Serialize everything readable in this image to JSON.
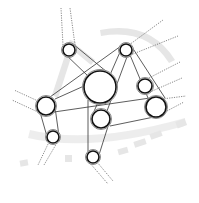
{
  "diagram": {
    "type": "belt-pulley-network",
    "width": 199,
    "height": 203,
    "colors": {
      "line": "#333333",
      "dashed": "#555555",
      "ring": "#111111",
      "watermark": "#e6e6e6"
    },
    "pulleys": [
      {
        "id": "A",
        "cx": 69,
        "cy": 50,
        "r": 6
      },
      {
        "id": "B",
        "cx": 100,
        "cy": 87,
        "r": 16
      },
      {
        "id": "C",
        "cx": 126,
        "cy": 50,
        "r": 6
      },
      {
        "id": "D",
        "cx": 145,
        "cy": 86,
        "r": 7
      },
      {
        "id": "E",
        "cx": 156,
        "cy": 107,
        "r": 10
      },
      {
        "id": "F",
        "cx": 46,
        "cy": 106,
        "r": 9
      },
      {
        "id": "G",
        "cx": 53,
        "cy": 137,
        "r": 6
      },
      {
        "id": "H",
        "cx": 101,
        "cy": 119,
        "r": 9
      },
      {
        "id": "I",
        "cx": 93,
        "cy": 157,
        "r": 6
      }
    ],
    "belts": [
      {
        "from": [
          63,
          52
        ],
        "to": [
          88,
          76
        ]
      },
      {
        "from": [
          73,
          44
        ],
        "to": [
          113,
          77
        ]
      },
      {
        "from": [
          120,
          52
        ],
        "to": [
          92,
          116
        ]
      },
      {
        "from": [
          131,
          46
        ],
        "to": [
          107,
          111
        ]
      },
      {
        "from": [
          121,
          46
        ],
        "to": [
          50,
          97
        ]
      },
      {
        "from": [
          84,
          86
        ],
        "to": [
          55,
          99
        ]
      },
      {
        "from": [
          130,
          55
        ],
        "to": [
          148,
          98
        ]
      },
      {
        "from": [
          130,
          44
        ],
        "to": [
          165,
          98
        ]
      },
      {
        "from": [
          54,
          112
        ],
        "to": [
          150,
          98
        ]
      },
      {
        "from": [
          110,
          126
        ],
        "to": [
          154,
          117
        ]
      },
      {
        "from": [
          40,
          112
        ],
        "to": [
          48,
          140
        ]
      },
      {
        "from": [
          54,
          100
        ],
        "to": [
          59,
          136
        ]
      },
      {
        "from": [
          88,
          100
        ],
        "to": [
          88,
          155
        ]
      },
      {
        "from": [
          110,
          120
        ],
        "to": [
          98,
          158
        ]
      }
    ],
    "dashed_extensions": [
      {
        "from": [
          63,
          45
        ],
        "to": [
          61,
          8
        ]
      },
      {
        "from": [
          75,
          45
        ],
        "to": [
          70,
          8
        ]
      },
      {
        "from": [
          129,
          45
        ],
        "to": [
          163,
          20
        ]
      },
      {
        "from": [
          128,
          56
        ],
        "to": [
          178,
          36
        ]
      },
      {
        "from": [
          147,
          79
        ],
        "to": [
          180,
          62
        ]
      },
      {
        "from": [
          150,
          92
        ],
        "to": [
          182,
          78
        ]
      },
      {
        "from": [
          162,
          99
        ],
        "to": [
          186,
          96
        ]
      },
      {
        "from": [
          165,
          112
        ],
        "to": [
          184,
          102
        ]
      },
      {
        "from": [
          38,
          101
        ],
        "to": [
          14,
          90
        ]
      },
      {
        "from": [
          40,
          113
        ],
        "to": [
          12,
          100
        ]
      },
      {
        "from": [
          49,
          142
        ],
        "to": [
          38,
          165
        ]
      },
      {
        "from": [
          58,
          141
        ],
        "to": [
          44,
          165
        ]
      },
      {
        "from": [
          89,
          162
        ],
        "to": [
          108,
          184
        ]
      },
      {
        "from": [
          97,
          162
        ],
        "to": [
          113,
          181
        ]
      }
    ]
  }
}
